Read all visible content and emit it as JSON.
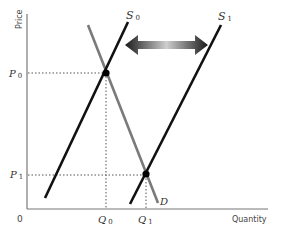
{
  "chart_data": {
    "type": "line",
    "title": "",
    "xlabel": "Quantity",
    "ylabel": "Price",
    "origin_label": "0",
    "grid": false,
    "legend": null,
    "series": [
      {
        "name": "S0",
        "label_main": "S",
        "label_sub": "0",
        "role": "supply (initial)",
        "color": "#111111",
        "points": [
          [
            45,
            198
          ],
          [
            128,
            22
          ]
        ]
      },
      {
        "name": "S1",
        "label_main": "S",
        "label_sub": "1",
        "role": "supply (shifted right)",
        "color": "#111111",
        "points": [
          [
            130,
            204
          ],
          [
            221,
            25
          ]
        ]
      },
      {
        "name": "D",
        "label_main": "D",
        "label_sub": "",
        "role": "demand",
        "color": "#7a7a7a",
        "points": [
          [
            88,
            25
          ],
          [
            158,
            203
          ]
        ]
      }
    ],
    "equilibria": [
      {
        "name": "E0",
        "price_label": "P0",
        "quantity_label": "Q0",
        "point": [
          106,
          73
        ]
      },
      {
        "name": "E1",
        "price_label": "P1",
        "quantity_label": "Q1",
        "point": [
          146,
          174
        ]
      }
    ],
    "y_ticks": [
      {
        "main": "P",
        "sub": "0",
        "y": 73
      },
      {
        "main": "P",
        "sub": "1",
        "y": 175
      }
    ],
    "x_ticks": [
      {
        "main": "Q",
        "sub": "0",
        "x": 106
      },
      {
        "main": "Q",
        "sub": "1",
        "x": 146
      }
    ],
    "annotations": [
      {
        "type": "double-arrow",
        "meaning": "supply curve shift between S0 and S1",
        "from": [
          125,
          45
        ],
        "to": [
          208,
          45
        ]
      }
    ],
    "axes": {
      "origin": [
        27,
        209
      ],
      "x_end": 268,
      "y_top": 14
    }
  }
}
